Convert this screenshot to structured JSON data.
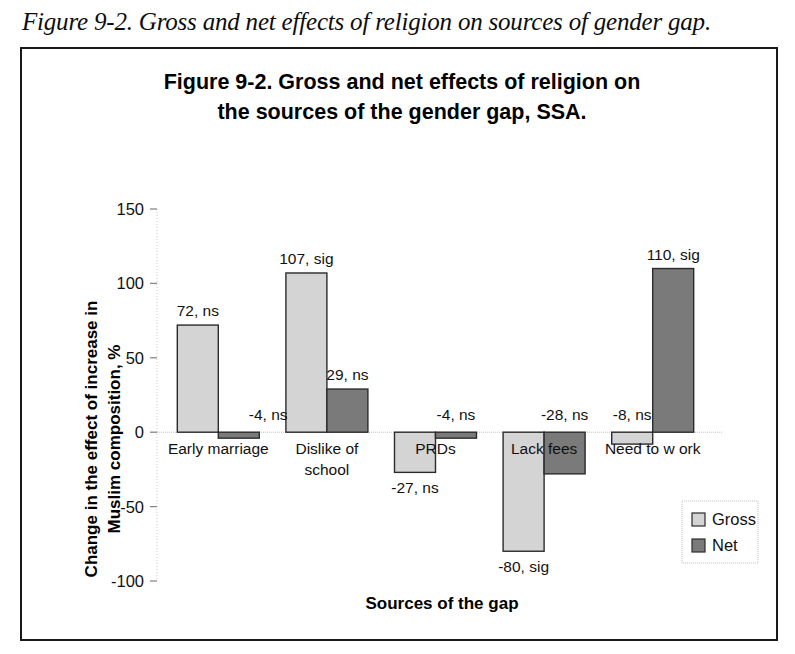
{
  "caption": "Figure 9-2. Gross and net effects of religion on sources of gender gap.",
  "chart_data": {
    "type": "bar",
    "title_line1": "Figure 9-2. Gross and net effects of religion on",
    "title_line2": "the sources of the gender gap, SSA.",
    "xlabel": "Sources of the gap",
    "ylabel_line1": "Change in the effect of increase in",
    "ylabel_line2": "Muslim composition, %",
    "categories": [
      "Early marriage",
      "Dislike of school",
      "PRDs",
      "Lack fees",
      "Need to work"
    ],
    "category_lines": [
      [
        "Early marriage"
      ],
      [
        "Dislike of",
        "school"
      ],
      [
        "PRDs"
      ],
      [
        "Lack fees"
      ],
      [
        "Need to w ork"
      ]
    ],
    "series": [
      {
        "name": "Gross",
        "color": "#d4d4d4",
        "values": [
          72,
          107,
          -27,
          -80,
          -8
        ],
        "labels": [
          "72, ns",
          "107, sig",
          "-27, ns",
          "-80, sig",
          "-8, ns"
        ]
      },
      {
        "name": "Net",
        "color": "#7a7a7a",
        "values": [
          -4,
          29,
          -4,
          -28,
          110
        ],
        "labels": [
          "-4, ns",
          "29, ns",
          "-4, ns",
          "-28, ns",
          "110, sig"
        ]
      }
    ],
    "yticks": [
      150,
      100,
      50,
      0,
      -50,
      -100
    ],
    "ytick_labels": [
      "150",
      "100",
      "50",
      "0",
      "-50",
      "-100"
    ],
    "ylim": [
      -100,
      150
    ],
    "grid": false,
    "legend_position": "bottom-right",
    "legend_entries": [
      "Gross",
      "Net"
    ]
  }
}
